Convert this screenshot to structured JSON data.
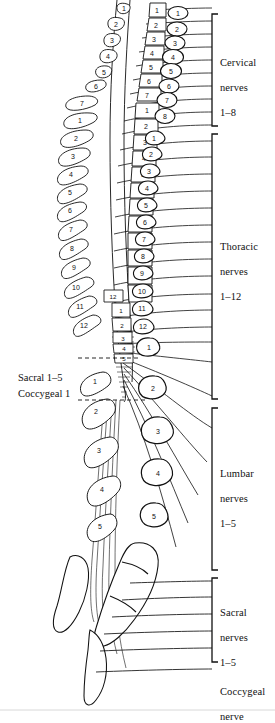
{
  "figure": {
    "type": "anatomical-line-diagram",
    "ink_color": "#111111",
    "background_color": "#ffffff"
  },
  "region_labels": [
    {
      "id": "cervical",
      "text": "Cervical\nnerves\n1–8",
      "line1": "Cervical",
      "line2": "nerves",
      "line3": "1–8"
    },
    {
      "id": "thoracic",
      "text": "Thoracic\nnerves\n1–12",
      "line1": "Thoracic",
      "line2": "nerves",
      "line3": "1–12"
    },
    {
      "id": "lumbar",
      "text": "Lumbar\nnerves\n1–5",
      "line1": "Lumbar",
      "line2": "nerves",
      "line3": "1–5"
    },
    {
      "id": "sacral",
      "text": "Sacral\nnerves\n1–5",
      "line1": "Sacral",
      "line2": "nerves",
      "line3": "1–5"
    },
    {
      "id": "coccygeal",
      "text": "Coccygeal\nnerve",
      "line1": "Coccygeal",
      "line2": "nerve",
      "line3": ""
    }
  ],
  "segment_callouts": [
    {
      "id": "sacral-1-5",
      "text": "Sacral 1–5"
    },
    {
      "id": "coccygeal-1",
      "text": "Coccygeal 1"
    }
  ],
  "spinous_processes": {
    "description": "Left-side spinous process outlines, numbered per region",
    "cervical": [
      "1",
      "2",
      "3",
      "4",
      "5",
      "6",
      "7"
    ],
    "thoracic": [
      "1",
      "2",
      "3",
      "4",
      "5",
      "6",
      "7",
      "8",
      "9",
      "10",
      "11",
      "12"
    ],
    "lumbar": [
      "1",
      "2",
      "3",
      "4",
      "5"
    ]
  },
  "vertebral_bodies": {
    "description": "Central column of vertebral body blocks, numbered per region",
    "cervical": [
      "1",
      "2",
      "3",
      "4",
      "5",
      "6",
      "7"
    ],
    "thoracic": [
      "1",
      "2",
      "3",
      "4",
      "5",
      "6",
      "7",
      "8",
      "9",
      "10",
      "11",
      "12"
    ]
  },
  "cord_segments": {
    "description": "Spinal cord segments marked within the cord shading near the conus",
    "lumbar": [
      "1",
      "2",
      "3",
      "4",
      "5"
    ],
    "sacral": [
      "1",
      "2",
      "3",
      "4",
      "5"
    ],
    "coccygeal": [
      "1"
    ]
  },
  "nerve_roots": {
    "description": "Right-side circled nerve root numbers emerging between vertebrae",
    "cervical": [
      "1",
      "2",
      "3",
      "4",
      "5",
      "6",
      "7",
      "8"
    ],
    "thoracic": [
      "1",
      "2",
      "3",
      "4",
      "5",
      "6",
      "7",
      "8",
      "9",
      "10",
      "11",
      "12"
    ],
    "lumbar": [
      "1",
      "2",
      "3",
      "4",
      "5"
    ]
  },
  "brackets": [
    {
      "id": "cervical-bracket",
      "top": 14,
      "bottom": 126
    },
    {
      "id": "thoracic-bracket",
      "top": 134,
      "bottom": 399
    },
    {
      "id": "lumbar-bracket",
      "top": 408,
      "bottom": 570
    },
    {
      "id": "sacral-bracket",
      "top": 578,
      "bottom": 662
    }
  ]
}
